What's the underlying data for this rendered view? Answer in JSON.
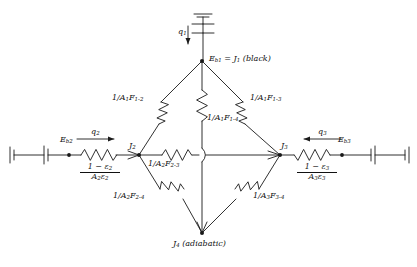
{
  "nodes": {
    "top": {
      "label_html": "E<sub>b1</sub> = J<sub>1</sub> (black)",
      "x": 202,
      "y": 59
    },
    "left": {
      "label_html": "J<sub>2</sub>",
      "x": 138,
      "y": 152
    },
    "right": {
      "label_html": "J<sub>3</sub>",
      "x": 281,
      "y": 152
    },
    "bottom": {
      "label_html": "J<sub>4</sub> (adiabatic)",
      "x": 202,
      "y": 242
    },
    "left_source": {
      "label_html": "E<sub>b2</sub>",
      "x": 69,
      "y": 152
    },
    "right_source": {
      "label_html": "E<sub>b3</sub>",
      "x": 342,
      "y": 152
    }
  },
  "heat_flows": [
    {
      "name": "q1",
      "label_html": "q<sub>1</sub>",
      "direction": "down"
    },
    {
      "name": "q2",
      "label_html": "q<sub>2</sub>",
      "direction": "right"
    },
    {
      "name": "q3",
      "label_html": "q<sub>3</sub>",
      "direction": "left"
    }
  ],
  "resistors": [
    {
      "name": "r-1-2",
      "label_html": "1/A<sub>1</sub>F<sub>1-2</sub>",
      "from": "top",
      "to": "left"
    },
    {
      "name": "r-1-3",
      "label_html": "1/A<sub>1</sub>F<sub>1-3</sub>",
      "from": "top",
      "to": "right"
    },
    {
      "name": "r-1-4",
      "label_html": "1/A<sub>1</sub>F<sub>1-4</sub>",
      "from": "top",
      "to": "bottom"
    },
    {
      "name": "r-2-3",
      "label_html": "1/A<sub>2</sub>F<sub>2-3</sub>",
      "from": "left",
      "to": "right"
    },
    {
      "name": "r-2-4",
      "label_html": "1/A<sub>2</sub>F<sub>2-4</sub>",
      "from": "left",
      "to": "bottom"
    },
    {
      "name": "r-3-4",
      "label_html": "1/A<sub>3</sub>F<sub>3-4</sub>",
      "from": "right",
      "to": "bottom"
    }
  ],
  "surface_resistances": [
    {
      "name": "surface-2",
      "numerator_html": "1 &minus; &epsilon;<sub>2</sub>",
      "denominator_html": "A<sub>2</sub>&epsilon;<sub>2</sub>"
    },
    {
      "name": "surface-3",
      "numerator_html": "1 &minus; &epsilon;<sub>3</sub>",
      "denominator_html": "A<sub>3</sub>&epsilon;<sub>3</sub>"
    }
  ],
  "colors": {
    "line": "#1a1a1a",
    "background": "#ffffff",
    "text": "#111111"
  },
  "geometry": {
    "top_node": [
      202,
      61
    ],
    "left_node": [
      139,
      155
    ],
    "right_node": [
      280,
      155
    ],
    "bottom_node": [
      202,
      233
    ],
    "baseline_y": 155
  }
}
